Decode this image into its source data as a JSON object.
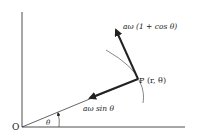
{
  "diagram": {
    "origin_label": "O",
    "angle_label": "θ",
    "point_label": "P (r, θ)",
    "radial_velocity_label": "aω sin θ",
    "transverse_velocity_label": "aω (1 + cos θ)"
  },
  "colors": {
    "ink": "#222222",
    "curve": "#555555",
    "background": "#ffffff"
  }
}
